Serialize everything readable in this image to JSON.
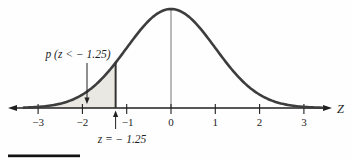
{
  "chart_data": {
    "type": "area",
    "distribution": "standard-normal-pdf",
    "title": "",
    "xlabel": "Z",
    "ylabel": "",
    "x_ticks": [
      -3,
      -2,
      -1,
      0,
      1,
      2,
      3
    ],
    "x_tick_labels": [
      "−3",
      "−2",
      "−1",
      "0",
      "1",
      "2",
      "3"
    ],
    "xlim": [
      -3.65,
      3.75
    ],
    "grid": false,
    "curve_z_range": [
      -3.32,
      3.42
    ],
    "mean_line_z": 0,
    "shaded_region": {
      "from": -3.32,
      "to": -1.25,
      "label": "p (z < − 1.25)"
    },
    "boundary": {
      "z": -1.25,
      "label": "z = − 1.25"
    },
    "colors": {
      "curve": "#3d3d3d",
      "shade": "#e9e8e3",
      "boundary_line": "#333333",
      "mean_line": "#777777",
      "axis": "#1f1f1f"
    },
    "layout": {
      "center_x_px": 171,
      "px_per_unit": 44.3,
      "axis_y_px": 108,
      "peak_height_px": 99
    }
  }
}
